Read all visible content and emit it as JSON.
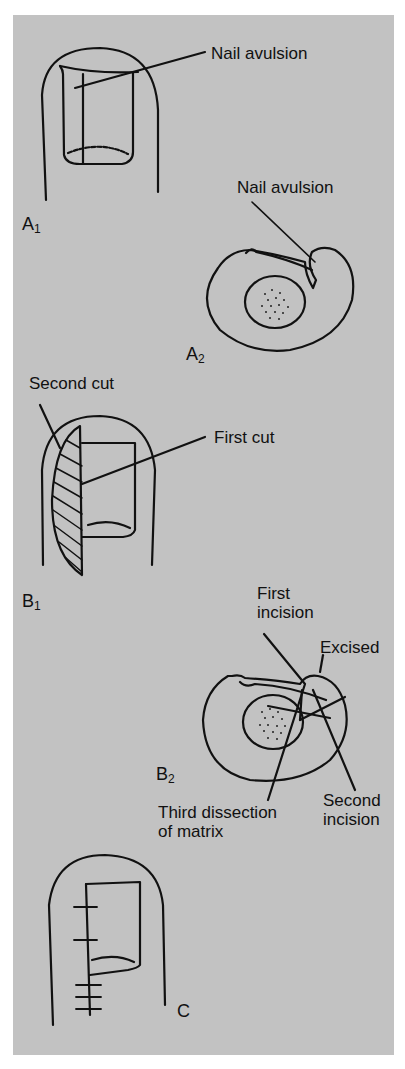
{
  "figure": {
    "background_color": "#c2c2c2",
    "panels": [
      {
        "id": "A1",
        "label_main": "A",
        "label_sub": "1",
        "annotations": [
          "Nail avulsion"
        ]
      },
      {
        "id": "A2",
        "label_main": "A",
        "label_sub": "2",
        "annotations": [
          "Nail avulsion"
        ]
      },
      {
        "id": "B1",
        "label_main": "B",
        "label_sub": "1",
        "annotations": [
          "Second cut",
          "First cut"
        ]
      },
      {
        "id": "B2",
        "label_main": "B",
        "label_sub": "2",
        "annotations": [
          "First incision",
          "Excised",
          "Third dissection of matrix",
          "Second incision"
        ]
      },
      {
        "id": "C",
        "label_main": "C",
        "label_sub": "",
        "annotations": []
      }
    ]
  },
  "labels": {
    "a1_nail_avulsion": "Nail avulsion",
    "a2_nail_avulsion": "Nail avulsion",
    "b1_second_cut": "Second cut",
    "b1_first_cut": "First cut",
    "b2_first_incision_l1": "First",
    "b2_first_incision_l2": "incision",
    "b2_excised": "Excised",
    "b2_third_l1": "Third dissection",
    "b2_third_l2": "of matrix",
    "b2_second_incision_l1": "Second",
    "b2_second_incision_l2": "incision"
  }
}
